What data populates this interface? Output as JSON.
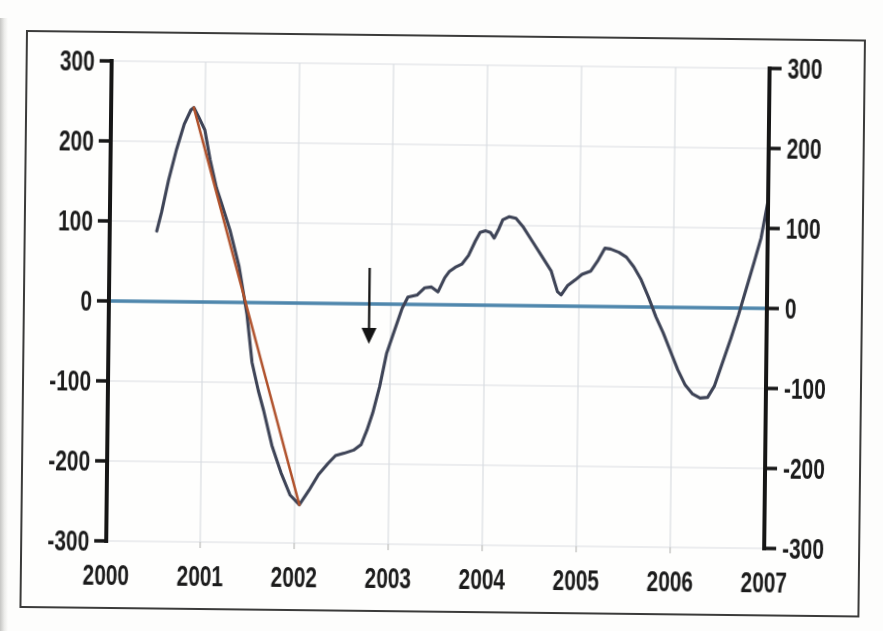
{
  "figure": {
    "background": "#fefefd",
    "border_color": "#3b3b3a"
  },
  "chart_data": {
    "type": "line",
    "title": "",
    "xlabel": "",
    "ylabel": "",
    "xlim": [
      2000,
      2007
    ],
    "ylim": [
      -300,
      300
    ],
    "grid": true,
    "dual_y_axis": true,
    "legend": null,
    "x_tick_labels": [
      "2000",
      "2001",
      "2002",
      "2003",
      "2004",
      "2005",
      "2006",
      "2007"
    ],
    "y_tick_values": [
      300,
      200,
      100,
      0,
      -100,
      -200,
      -300
    ],
    "y_tick_labels_left": [
      "300",
      "200",
      "100",
      "0",
      "-100",
      "-200",
      "-300"
    ],
    "y_tick_labels_right": [
      "300",
      "200",
      "100",
      "0",
      "-100",
      "-200",
      "-300"
    ],
    "axis_color": "#161616",
    "grid_color": "#d9dce1",
    "tick_label_color": "#1c1c1c",
    "series": [
      {
        "name": "indicator-series",
        "color": "#3e4457",
        "stroke_width": 3.1,
        "points": [
          [
            2000.5,
            88
          ],
          [
            2000.55,
            112
          ],
          [
            2000.62,
            152
          ],
          [
            2000.7,
            190
          ],
          [
            2000.78,
            222
          ],
          [
            2000.85,
            240
          ],
          [
            2000.88,
            243
          ],
          [
            2000.93,
            232
          ],
          [
            2001.0,
            215
          ],
          [
            2001.06,
            178
          ],
          [
            2001.13,
            143
          ],
          [
            2001.18,
            126
          ],
          [
            2001.28,
            90
          ],
          [
            2001.38,
            45
          ],
          [
            2001.47,
            -15
          ],
          [
            2001.53,
            -75
          ],
          [
            2001.6,
            -110
          ],
          [
            2001.66,
            -135
          ],
          [
            2001.75,
            -178
          ],
          [
            2001.85,
            -212
          ],
          [
            2001.95,
            -240
          ],
          [
            2002.05,
            -252
          ],
          [
            2002.15,
            -234
          ],
          [
            2002.25,
            -214
          ],
          [
            2002.35,
            -200
          ],
          [
            2002.43,
            -190
          ],
          [
            2002.52,
            -187
          ],
          [
            2002.62,
            -183
          ],
          [
            2002.7,
            -176
          ],
          [
            2002.76,
            -158
          ],
          [
            2002.82,
            -136
          ],
          [
            2002.89,
            -103
          ],
          [
            2002.96,
            -62
          ],
          [
            2003.04,
            -33
          ],
          [
            2003.12,
            -5
          ],
          [
            2003.18,
            9
          ],
          [
            2003.28,
            12
          ],
          [
            2003.36,
            21
          ],
          [
            2003.43,
            22
          ],
          [
            2003.5,
            16
          ],
          [
            2003.57,
            34
          ],
          [
            2003.62,
            42
          ],
          [
            2003.68,
            47
          ],
          [
            2003.75,
            51
          ],
          [
            2003.82,
            62
          ],
          [
            2003.89,
            80
          ],
          [
            2003.94,
            91
          ],
          [
            2004.0,
            93
          ],
          [
            2004.05,
            91
          ],
          [
            2004.09,
            84
          ],
          [
            2004.14,
            96
          ],
          [
            2004.18,
            107
          ],
          [
            2004.25,
            111
          ],
          [
            2004.32,
            109
          ],
          [
            2004.4,
            98
          ],
          [
            2004.5,
            80
          ],
          [
            2004.6,
            62
          ],
          [
            2004.7,
            44
          ],
          [
            2004.77,
            18
          ],
          [
            2004.81,
            14
          ],
          [
            2004.88,
            26
          ],
          [
            2004.96,
            33
          ],
          [
            2005.03,
            40
          ],
          [
            2005.12,
            44
          ],
          [
            2005.2,
            58
          ],
          [
            2005.27,
            73
          ],
          [
            2005.33,
            72
          ],
          [
            2005.42,
            68
          ],
          [
            2005.5,
            62
          ],
          [
            2005.58,
            50
          ],
          [
            2005.66,
            34
          ],
          [
            2005.74,
            12
          ],
          [
            2005.82,
            -12
          ],
          [
            2005.9,
            -32
          ],
          [
            2005.98,
            -55
          ],
          [
            2006.06,
            -78
          ],
          [
            2006.14,
            -97
          ],
          [
            2006.22,
            -108
          ],
          [
            2006.3,
            -113
          ],
          [
            2006.38,
            -112
          ],
          [
            2006.45,
            -98
          ],
          [
            2006.53,
            -70
          ],
          [
            2006.62,
            -38
          ],
          [
            2006.7,
            -8
          ],
          [
            2006.78,
            25
          ],
          [
            2006.86,
            58
          ],
          [
            2006.93,
            88
          ],
          [
            2007.0,
            135
          ]
        ]
      },
      {
        "name": "peak-to-trough-trend",
        "color": "#b0522c",
        "stroke_width": 2.5,
        "points": [
          [
            2000.88,
            243
          ],
          [
            2002.05,
            -252
          ]
        ]
      },
      {
        "name": "zero-baseline",
        "color": "#4e86ac",
        "stroke_width": 3.3,
        "points": [
          [
            2000,
            0
          ],
          [
            2007,
            0
          ]
        ]
      }
    ],
    "annotations": [
      {
        "type": "down-arrow",
        "color": "#141414",
        "x": 2002.77,
        "y_start": 45,
        "y_end": -50
      }
    ]
  }
}
